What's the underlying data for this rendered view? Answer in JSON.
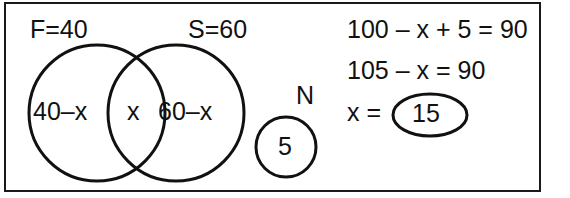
{
  "figure": {
    "type": "venn-diagram-with-worked-solution",
    "ink_color": "#111111",
    "background_color": "#ffffff"
  },
  "venn": {
    "set_labels": [
      {
        "name": "F",
        "text": "F=40"
      },
      {
        "name": "S",
        "text": "S=60"
      },
      {
        "name": "N",
        "text": "N"
      }
    ],
    "regions": [
      {
        "name": "f-only",
        "text": "40–x"
      },
      {
        "name": "intersection",
        "text": "x"
      },
      {
        "name": "s-only",
        "text": "60–x"
      },
      {
        "name": "neither",
        "text": "5"
      }
    ]
  },
  "solution": {
    "lines": [
      "100 – x + 5 = 90",
      "105 – x = 90",
      "x ="
    ],
    "answer": "15"
  }
}
